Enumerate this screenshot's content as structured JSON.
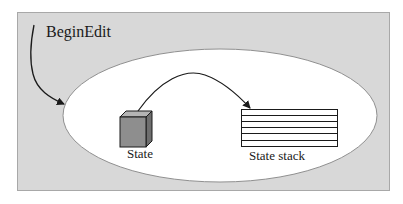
{
  "diagram": {
    "colors": {
      "panel_fill": "#d8d8d8",
      "panel_border": "#a8a8a8",
      "ellipse_fill": "#ffffff",
      "ellipse_stroke": "#909090",
      "cube_front": "#8e8e8e",
      "cube_top": "#b4b4b4",
      "cube_side": "#6e6e6e",
      "line": "#1a1a1a"
    },
    "labels": {
      "begin_edit": "BeginEdit",
      "state": "State",
      "state_stack": "State stack"
    },
    "nodes": [
      {
        "id": "state",
        "shape": "cube",
        "label": "State"
      },
      {
        "id": "state_stack",
        "shape": "stack",
        "label": "State stack",
        "rows": 6
      }
    ],
    "edges": [
      {
        "from": "BeginEdit",
        "to": "ellipse",
        "style": "curved-arrow"
      },
      {
        "from": "state",
        "to": "state_stack",
        "style": "curved-arrow"
      }
    ]
  }
}
